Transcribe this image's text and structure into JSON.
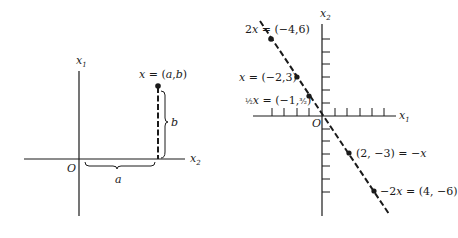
{
  "left_figure": {
    "axis_vertical_label": "x",
    "axis_vertical_sub": "1",
    "axis_horizontal_label": "x",
    "axis_horizontal_sub": "2",
    "origin_label": "O",
    "point_label": "x = (a,b)",
    "brace_horizontal_label": "a",
    "brace_vertical_label": "b"
  },
  "right_figure": {
    "axis_vertical_label": "x",
    "axis_vertical_sub": "2",
    "axis_horizontal_label": "x",
    "axis_horizontal_sub": "1",
    "origin_label": "O",
    "points": [
      {
        "label": "2x = (−4,6)",
        "coords": [
          -4,
          6
        ]
      },
      {
        "label": "x = (−2,3)",
        "coords": [
          -2,
          3
        ]
      },
      {
        "label": "½x = (−1,¾)",
        "coords": [
          -1,
          1.5
        ]
      },
      {
        "label": "(2, −3) = −x",
        "coords": [
          2,
          -3
        ]
      },
      {
        "label": "−2x = (4, −6)",
        "coords": [
          4,
          -6
        ]
      }
    ],
    "tick_spacing_px": 12.6
  }
}
